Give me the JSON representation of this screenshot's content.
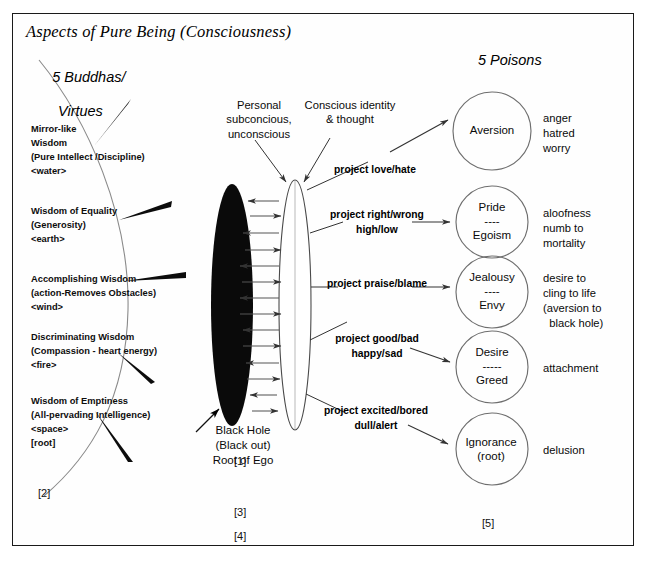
{
  "title": "Aspects of Pure Being (Consciousness)",
  "headings": {
    "left_line1": "5 Buddhas/",
    "left_line2": "Virtues",
    "right": "5 Poisons"
  },
  "wisdoms": [
    {
      "lines": "Mirror-like\nWisdom\n(Pure Intellect /Discipline)\n<water>"
    },
    {
      "lines": "Wisdom of Equality\n(Generosity)\n<earth>"
    },
    {
      "lines": "Accomplishing Wisdom\n(action-Removes Obstacles)\n<wind>"
    },
    {
      "lines": "Discriminating Wisdom\n(Compassion - heart energy)\n<fire>"
    },
    {
      "lines": "Wisdom of Emptiness\n(All-pervading Intelligence)\n<space>\n[root]"
    }
  ],
  "callouts": {
    "subconscious": "Personal\nsubconcious,\nunconscious",
    "conscious": "Conscious identity\n& thought"
  },
  "projections": [
    {
      "text": "project love/hate"
    },
    {
      "text": "project right/wrong\nhigh/low"
    },
    {
      "text": "project praise/blame"
    },
    {
      "text": "project good/bad\nhappy/sad"
    },
    {
      "text": "project excited/bored\ndull/alert"
    }
  ],
  "black_hole": {
    "caption": "Black Hole\n(Black out)\nRoot of Ego"
  },
  "poisons": [
    {
      "label": "Aversion",
      "divider": "",
      "label2": "",
      "desc": "anger\nhatred\nworry"
    },
    {
      "label": "Pride",
      "divider": "----",
      "label2": "Egoism",
      "desc": "aloofness\nnumb to\nmortality"
    },
    {
      "label": "Jealousy",
      "divider": "----",
      "label2": "Envy",
      "desc": "desire to\ncling to life\n(aversion to\n  black hole)"
    },
    {
      "label": "Desire",
      "divider": "-----",
      "label2": "Greed",
      "desc": "attachment"
    },
    {
      "label": "Ignorance",
      "divider": "",
      "label2": "(root)",
      "desc": "delusion"
    }
  ],
  "markers": {
    "left_column": "[2]",
    "black_hole": "[1]",
    "third": "[3]",
    "fourth": "[4]",
    "poisons": "[5]"
  },
  "colors": {
    "ink": "#000000",
    "frame": "#1a1a1a",
    "black_hole_fill": "#0a0a0a",
    "paper": "#ffffff"
  }
}
